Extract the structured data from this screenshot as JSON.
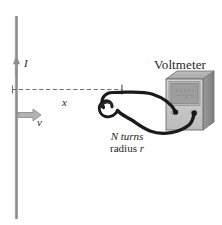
{
  "figure": {
    "background_color": "#ffffff"
  },
  "labels": {
    "current": "I",
    "velocity": "v",
    "distance": "x",
    "voltmeter": "Voltmeter",
    "coil_turns": "N turns",
    "coil_radius_prefix": "radius ",
    "coil_radius_symbol": "r"
  },
  "colors": {
    "wire_gray": "#8c8c8c",
    "arrow_gray": "#9a9a9a",
    "dash_gray": "#6f6f6f",
    "coil_black": "#1a1a1a",
    "meter_face": "#c8c8c8",
    "meter_body": "#b0b0b0",
    "meter_screen": "#9e9e9e",
    "meter_side": "#8a8a8a",
    "text": "#231f20"
  },
  "elements": {
    "vertical_wire": "current-carrying-wire",
    "current_arrow": "current-direction-arrow",
    "velocity_arrow": "velocity-direction-arrow",
    "distance_line": "distance-dashed-line",
    "coil": "n-turn-coil",
    "lead_wires": "coil-to-voltmeter-leads",
    "voltmeter": "voltmeter-device",
    "terminals": [
      "voltmeter-terminal-left",
      "voltmeter-terminal-right"
    ]
  }
}
